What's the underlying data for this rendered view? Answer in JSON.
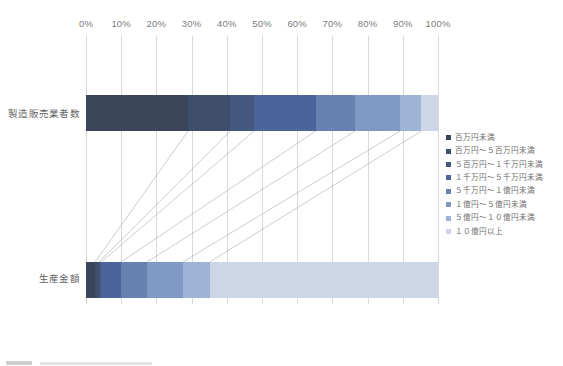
{
  "chart": {
    "type": "bar",
    "title": "",
    "orientation": "horizontal-100pct-stacked"
  },
  "axis": {
    "tick_labels": [
      "0%",
      "10%",
      "20%",
      "30%",
      "40%",
      "50%",
      "60%",
      "70%",
      "80%",
      "90%",
      "100%"
    ],
    "tick_values": [
      0,
      10,
      20,
      30,
      40,
      50,
      60,
      70,
      80,
      90,
      100
    ],
    "min": 0,
    "max": 100,
    "grid": true,
    "position": "top"
  },
  "categories": [
    {
      "label": "製造販売業者数"
    },
    {
      "label": "生産金額"
    }
  ],
  "legend": {
    "position": "right",
    "items": [
      {
        "label": "百万円未満",
        "color": "#3b4559"
      },
      {
        "label": "百万円～５百万円未満",
        "color": "#3f4f6b"
      },
      {
        "label": "５百万円～１千万円未満",
        "color": "#44587d"
      },
      {
        "label": "１千万円～５千万円未満",
        "color": "#4b659a"
      },
      {
        "label": "５千万円～１億円未満",
        "color": "#6981b0"
      },
      {
        "label": "１億円～５億円未満",
        "color": "#8099c4"
      },
      {
        "label": "５億円～１０億円未満",
        "color": "#9fb3d6"
      },
      {
        "label": "１０億円以上",
        "color": "#ccd6e6"
      }
    ]
  },
  "chart_data": {
    "type": "bar",
    "title": "",
    "xlabel": "",
    "ylabel": "",
    "xlim": [
      0,
      100
    ],
    "grid": true,
    "legend_position": "right",
    "stacked": true,
    "normalized_percent": true,
    "categories": [
      "製造販売業者数",
      "生産金額"
    ],
    "tick_labels": [
      "0%",
      "10%",
      "20%",
      "30%",
      "40%",
      "50%",
      "60%",
      "70%",
      "80%",
      "90%",
      "100%"
    ],
    "series": [
      {
        "name": "百万円未満",
        "color": "#3b4559",
        "values": [
          29.0,
          2.6
        ]
      },
      {
        "name": "百万円～５百万円未満",
        "color": "#3f4f6b",
        "values": [
          12.0,
          1.1
        ]
      },
      {
        "name": "５百万円～１千万円未満",
        "color": "#44587d",
        "values": [
          6.8,
          0.6
        ]
      },
      {
        "name": "１千万円～５千万円未満",
        "color": "#4b659a",
        "values": [
          17.5,
          5.6
        ]
      },
      {
        "name": "５千万円～１億円未満",
        "color": "#6981b0",
        "values": [
          11.2,
          7.4
        ]
      },
      {
        "name": "１億円～５億円未満",
        "color": "#8099c4",
        "values": [
          12.7,
          10.2
        ]
      },
      {
        "name": "５億円～１０億円未満",
        "color": "#9fb3d6",
        "values": [
          6.1,
          7.6
        ]
      },
      {
        "name": "１０億円以上",
        "color": "#ccd6e6",
        "values": [
          4.7,
          64.9
        ]
      }
    ]
  }
}
